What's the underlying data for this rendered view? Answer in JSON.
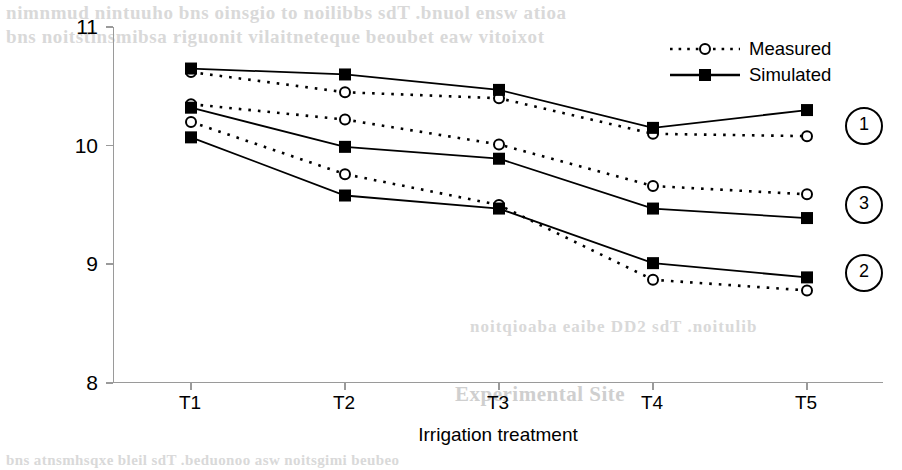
{
  "chart_data": {
    "type": "line",
    "title": "",
    "xlabel": "Irrigation treatment",
    "ylabel": "Above ground dry matter, t/ha",
    "categories": [
      "T1",
      "T2",
      "T3",
      "T4",
      "T5"
    ],
    "yticks": [
      8,
      9,
      10,
      11
    ],
    "ylim": [
      8,
      11
    ],
    "grid": false,
    "legend_position": "top-right",
    "legend": [
      {
        "label": "Measured",
        "marker": "open-circle",
        "line": "dotted"
      },
      {
        "label": "Simulated",
        "marker": "filled-square",
        "line": "solid"
      }
    ],
    "group_labels": [
      "1",
      "3",
      "2"
    ],
    "series": [
      {
        "name": "Measured 1",
        "group": "1",
        "style": "dotted",
        "marker": "open-circle",
        "values": [
          10.62,
          10.45,
          10.4,
          10.1,
          10.08
        ]
      },
      {
        "name": "Simulated 1",
        "group": "1",
        "style": "solid",
        "marker": "filled-square",
        "values": [
          10.65,
          10.6,
          10.47,
          10.15,
          10.3
        ]
      },
      {
        "name": "Measured 3",
        "group": "3",
        "style": "dotted",
        "marker": "open-circle",
        "values": [
          10.35,
          10.22,
          10.01,
          9.66,
          9.59
        ]
      },
      {
        "name": "Simulated 3",
        "group": "3",
        "style": "solid",
        "marker": "filled-square",
        "values": [
          10.32,
          9.99,
          9.89,
          9.47,
          9.39
        ]
      },
      {
        "name": "Measured 2",
        "group": "2",
        "style": "dotted",
        "marker": "open-circle",
        "values": [
          10.2,
          9.76,
          9.5,
          8.87,
          8.78
        ]
      },
      {
        "name": "Simulated 2",
        "group": "2",
        "style": "solid",
        "marker": "filled-square",
        "values": [
          10.07,
          9.58,
          9.47,
          9.01,
          8.89
        ]
      }
    ],
    "callouts": [
      {
        "label": "1",
        "y_value": 10.18
      },
      {
        "label": "3",
        "y_value": 9.52
      },
      {
        "label": "2",
        "y_value": 8.94
      }
    ]
  },
  "background_text": {
    "line1": "nimnmud nintuuho bns oinsgio to noilibbs sdT .bnuol ensw atioa",
    "line2": "bns noitstinsmibsa riguonit vilaitneteque beoubet eaw vitoixot",
    "line3": "noitqioaba eaibe DD2 sdT .noitulib",
    "line4": "Experimental Site",
    "line5": "bns atnsmhsqxe bleil sdT .beduonoo asw noitsgimi beubeo"
  }
}
